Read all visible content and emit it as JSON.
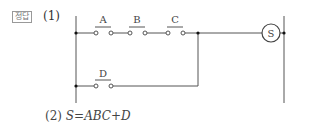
{
  "badge": "정답",
  "part1_label": "(1)",
  "part2_label": "(2)",
  "formula": "S = ABC + D",
  "formula_lhs": "S",
  "formula_eq": "=",
  "formula_rhs": "ABC+D",
  "circuit": {
    "contacts_series": [
      "A",
      "B",
      "C"
    ],
    "contact_parallel": "D",
    "load": "S"
  }
}
